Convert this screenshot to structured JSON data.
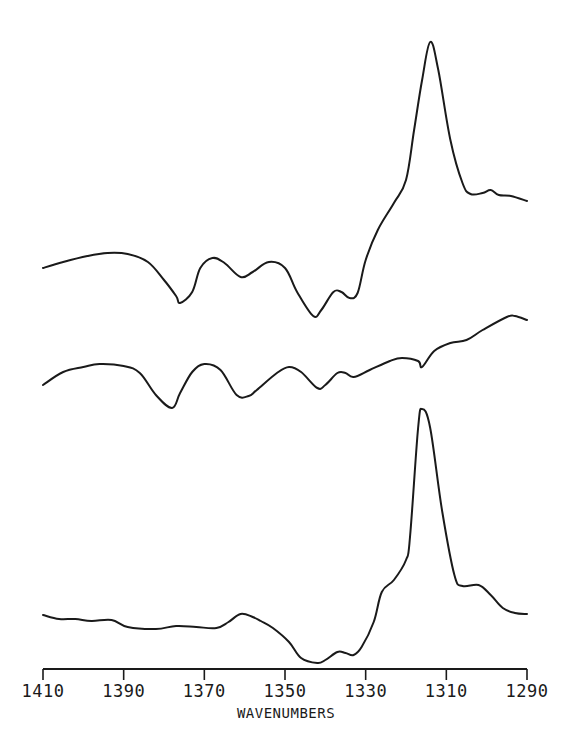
{
  "chart_data": {
    "type": "line",
    "title": "",
    "xlabel": "WAVENUMBERS",
    "ylabel": "",
    "xlim": [
      1410,
      1290
    ],
    "x_reversed": true,
    "grid": false,
    "legend": null,
    "x_ticks": [
      1410,
      1390,
      1370,
      1350,
      1330,
      1310,
      1290
    ],
    "x_tick_labels": [
      "1410",
      "1390",
      "1370",
      "1350",
      "1330",
      "1310",
      "1290"
    ],
    "y_units": "relative (stacked traces, arbitrary offset)",
    "series": [
      {
        "name": "top-spectrum",
        "note": "pixel-y values (smaller = higher); strong positive peak near 1316 cm-1",
        "x": [
          1410,
          1405,
          1399,
          1394,
          1389,
          1384,
          1380,
          1377,
          1376,
          1373,
          1371,
          1368,
          1365,
          1361,
          1358,
          1354,
          1350,
          1347,
          1343,
          1341,
          1338,
          1336,
          1334,
          1332,
          1330,
          1327,
          1323,
          1320,
          1318,
          1316,
          1314,
          1312,
          1309,
          1306,
          1304,
          1301,
          1299,
          1297,
          1294,
          1290
        ],
        "y": [
          268,
          262,
          256,
          253,
          254,
          262,
          280,
          296,
          303,
          292,
          268,
          258,
          263,
          277,
          272,
          262,
          268,
          292,
          316,
          310,
          292,
          292,
          298,
          293,
          260,
          230,
          203,
          180,
          130,
          80,
          42,
          70,
          140,
          183,
          194,
          193,
          190,
          195,
          196,
          201
        ],
        "peak": {
          "x": 1316,
          "label": "main peak"
        }
      },
      {
        "name": "middle-spectrum",
        "note": "difference-like trace with oscillations, rising baseline to the right",
        "x": [
          1410,
          1405,
          1400,
          1396,
          1390,
          1386,
          1382,
          1378,
          1376,
          1373,
          1370,
          1366,
          1362,
          1359,
          1357,
          1352,
          1349,
          1346,
          1342,
          1340,
          1337,
          1335,
          1333,
          1329,
          1324,
          1321,
          1317,
          1316,
          1313,
          1309,
          1305,
          1301,
          1295,
          1293,
          1290
        ],
        "y": [
          385,
          372,
          367,
          364,
          366,
          373,
          395,
          408,
          393,
          372,
          364,
          370,
          395,
          396,
          390,
          373,
          367,
          372,
          388,
          385,
          373,
          373,
          377,
          370,
          361,
          358,
          361,
          367,
          351,
          343,
          340,
          330,
          317,
          316,
          320
        ]
      },
      {
        "name": "bottom-spectrum",
        "note": "flat baseline, dip near 1345 cm-1, strong positive peak near 1316 cm-1 with shoulder near 1303 cm-1",
        "x": [
          1410,
          1406,
          1402,
          1398,
          1393,
          1389,
          1382,
          1377,
          1372,
          1367,
          1364,
          1361,
          1358,
          1356,
          1353,
          1349,
          1346,
          1342,
          1340,
          1337,
          1335,
          1333,
          1331,
          1328,
          1326,
          1323,
          1320,
          1319,
          1317,
          1316,
          1314,
          1311,
          1308,
          1306,
          1302,
          1299,
          1296,
          1293,
          1290
        ],
        "y": [
          615,
          619,
          619,
          621,
          620,
          627,
          629,
          626,
          627,
          628,
          622,
          614,
          617,
          621,
          628,
          642,
          658,
          663,
          660,
          652,
          653,
          655,
          647,
          622,
          592,
          580,
          560,
          537,
          428,
          409,
          428,
          512,
          575,
          586,
          585,
          595,
          608,
          613,
          614
        ],
        "peak": {
          "x": 1316,
          "label": "main peak"
        }
      }
    ]
  },
  "axis": {
    "title": "WAVENUMBERS",
    "ticks": [
      {
        "value": "1410",
        "px": 43
      },
      {
        "value": "1390",
        "px": 112
      },
      {
        "value": "1370",
        "px": 183
      },
      {
        "value": "1350",
        "px": 256
      },
      {
        "value": "1330",
        "px": 329
      },
      {
        "value": "1310",
        "px": 398
      },
      {
        "value": "1290",
        "px": 527
      }
    ]
  },
  "colors": {
    "ink": "#1a1a1a",
    "background": "#ffffff"
  }
}
